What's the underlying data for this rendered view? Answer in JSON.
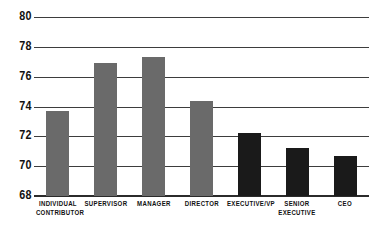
{
  "chart_data": {
    "type": "bar",
    "title": "",
    "subtitle": "",
    "xlabel": "",
    "ylabel": "",
    "ylim": [
      68,
      80
    ],
    "ytick_step": 2,
    "yticks": [
      68,
      70,
      72,
      74,
      76,
      78,
      80
    ],
    "ytick_labels": [
      "68",
      "70",
      "72",
      "74",
      "76",
      "78",
      "80"
    ],
    "grid": true,
    "grid_axis": "y",
    "legend": false,
    "legend_position": "none",
    "categories": [
      "INDIVIDUAL CONTRIBUTOR",
      "SUPERVISOR",
      "MANAGER",
      "DIRECTOR",
      "EXECUTIVE/VP",
      "SENIOR EXECUTIVE",
      "CEO"
    ],
    "values": [
      73.7,
      76.9,
      77.35,
      74.4,
      72.2,
      71.2,
      70.7
    ],
    "bar_colors": [
      "#6a6a6a",
      "#6a6a6a",
      "#6a6a6a",
      "#6a6a6a",
      "#1a1a1a",
      "#1a1a1a",
      "#1a1a1a"
    ],
    "bars": [
      {
        "category": "INDIVIDUAL CONTRIBUTOR",
        "label_line1": "INDIVIDUAL",
        "label_line2": "CONTRIBUTOR",
        "value": 73.7,
        "color": "#6a6a6a"
      },
      {
        "category": "SUPERVISOR",
        "label_line1": "SUPERVISOR",
        "label_line2": "",
        "value": 76.9,
        "color": "#6a6a6a"
      },
      {
        "category": "MANAGER",
        "label_line1": "MANAGER",
        "label_line2": "",
        "value": 77.35,
        "color": "#6a6a6a"
      },
      {
        "category": "DIRECTOR",
        "label_line1": "DIRECTOR",
        "label_line2": "",
        "value": 74.4,
        "color": "#6a6a6a"
      },
      {
        "category": "EXECUTIVE/VP",
        "label_line1": "EXECUTIVE/VP",
        "label_line2": "",
        "value": 72.2,
        "color": "#1a1a1a"
      },
      {
        "category": "SENIOR EXECUTIVE",
        "label_line1": "SENIOR",
        "label_line2": "EXECUTIVE",
        "value": 71.2,
        "color": "#1a1a1a"
      },
      {
        "category": "CEO",
        "label_line1": "CEO",
        "label_line2": "",
        "value": 70.7,
        "color": "#1a1a1a"
      }
    ]
  },
  "colors": {
    "background": "#ffffff",
    "gridline": "#3d3d3d",
    "axis": "#2b2b2b",
    "text": "#111111",
    "series_primary": "#6a6a6a",
    "series_highlight": "#1a1a1a"
  }
}
